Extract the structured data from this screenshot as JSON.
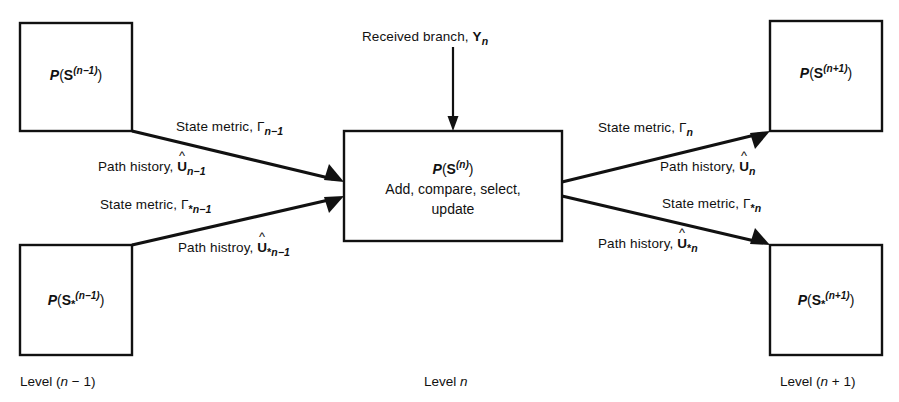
{
  "figure": {
    "background_color": "#ffffff",
    "ink_color": "#111111"
  },
  "boxes": {
    "top_left": {
      "name": "P(S^(n-1))",
      "text_parts": {
        "P": "P",
        "open": "(",
        "S": "S",
        "exp": "(n−1)",
        "close": ")"
      }
    },
    "bottom_left": {
      "name": "P(S_*^(n-1))",
      "text_parts": {
        "P": "P",
        "open": "(",
        "S": "S",
        "sub": "*",
        "exp": "(n−1)",
        "close": ")"
      }
    },
    "center": {
      "name": "P(S^(n))",
      "text_parts": {
        "P": "P",
        "open": "(",
        "S": "S",
        "exp": "(n)",
        "close": ")"
      },
      "line2": "Add, compare, select,",
      "line3": "update"
    },
    "top_right": {
      "name": "P(S^(n+1))",
      "text_parts": {
        "P": "P",
        "open": "(",
        "S": "S",
        "exp": "(n+1)",
        "close": ")"
      }
    },
    "bottom_right": {
      "name": "P(S_*^(n+1))",
      "text_parts": {
        "P": "P",
        "open": "(",
        "S": "S",
        "sub": "*",
        "exp": "(n+1)",
        "close": ")"
      }
    }
  },
  "arrow_labels": {
    "received_branch": {
      "prefix": "Received branch, ",
      "symbol": "Y",
      "index": "n"
    },
    "in_state_metric": {
      "prefix": "State metric, ",
      "symbol": "Γ",
      "index": "n−1",
      "star": ""
    },
    "in_path_history": {
      "prefix": "Path history, ",
      "symbol": "U",
      "hat": "^",
      "index": "n−1",
      "star": ""
    },
    "in_state_metric_star": {
      "prefix": "State metric, ",
      "symbol": "Γ",
      "index": "n−1",
      "star": "*"
    },
    "in_path_history_star": {
      "prefix": "Path histroy, ",
      "symbol": "U",
      "hat": "^",
      "index": "n−1",
      "star": "*"
    },
    "out_state_metric": {
      "prefix": "State metric, ",
      "symbol": "Γ",
      "index": "n",
      "star": ""
    },
    "out_path_history": {
      "prefix": "Path history, ",
      "symbol": "U",
      "hat": "^",
      "index": "n",
      "star": ""
    },
    "out_state_metric_star": {
      "prefix": "State metric, ",
      "symbol": "Γ",
      "index": "n",
      "star": "*"
    },
    "out_path_history_star": {
      "prefix": "Path history, ",
      "symbol": "U",
      "hat": "^",
      "index": "n",
      "star": "*"
    }
  },
  "level_labels": {
    "left": {
      "prefix": "Level (",
      "var": "n",
      "suffix": " − 1)"
    },
    "center": {
      "prefix": "Level ",
      "var": "n",
      "suffix": ""
    },
    "right": {
      "prefix": "Level (",
      "var": "n",
      "suffix": " + 1)"
    }
  }
}
